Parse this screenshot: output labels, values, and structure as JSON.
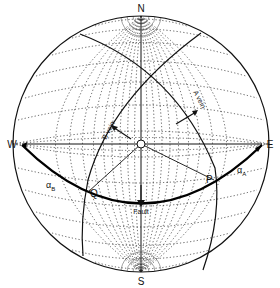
{
  "figure": {
    "type": "stereonet",
    "directions": {
      "north": "N",
      "south": "S",
      "east": "E",
      "west": "W"
    },
    "labels": {
      "a_vein": "A vein",
      "b_vein": "B vein",
      "fault": "Fault",
      "point_p": "P",
      "point_q": "Q",
      "alpha_a": "α",
      "alpha_a_sub": "A",
      "alpha_b": "α",
      "alpha_b_sub": "B"
    },
    "colors": {
      "ink": "#111111",
      "grid": "#333333",
      "background": "#ffffff"
    }
  }
}
